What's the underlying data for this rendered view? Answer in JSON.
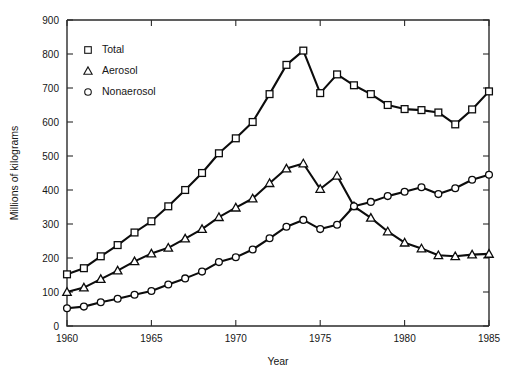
{
  "chart_data": {
    "type": "line",
    "title": "",
    "xlabel": "Year",
    "ylabel": "Millions of kilograms",
    "xlim": [
      1960,
      1985
    ],
    "ylim": [
      0,
      900
    ],
    "xticks": [
      1960,
      1965,
      1970,
      1975,
      1980,
      1985
    ],
    "yticks": [
      0,
      100,
      200,
      300,
      400,
      500,
      600,
      700,
      800,
      900
    ],
    "grid": false,
    "legend_position": "upper-left-inside",
    "x": [
      1960,
      1961,
      1962,
      1963,
      1964,
      1965,
      1966,
      1967,
      1968,
      1969,
      1970,
      1971,
      1972,
      1973,
      1974,
      1975,
      1976,
      1977,
      1978,
      1979,
      1980,
      1981,
      1982,
      1983,
      1984,
      1985
    ],
    "series": [
      {
        "name": "Total",
        "marker": "square",
        "values": [
          152,
          170,
          205,
          238,
          275,
          308,
          352,
          400,
          450,
          508,
          552,
          600,
          682,
          768,
          810,
          685,
          740,
          708,
          682,
          650,
          638,
          635,
          628,
          593,
          637,
          690
        ]
      },
      {
        "name": "Aerosol",
        "marker": "triangle",
        "values": [
          100,
          113,
          138,
          163,
          190,
          213,
          230,
          257,
          285,
          320,
          348,
          375,
          420,
          463,
          478,
          403,
          442,
          352,
          318,
          278,
          245,
          228,
          208,
          205,
          210,
          212
        ]
      },
      {
        "name": "Nonaerosol",
        "marker": "circle",
        "values": [
          52,
          57,
          70,
          80,
          92,
          103,
          122,
          140,
          160,
          188,
          202,
          225,
          258,
          292,
          312,
          285,
          298,
          352,
          365,
          382,
          395,
          408,
          388,
          405,
          430,
          445
        ]
      }
    ]
  },
  "legend": {
    "items": [
      {
        "label": "Total",
        "marker": "square"
      },
      {
        "label": "Aerosol",
        "marker": "triangle"
      },
      {
        "label": "Nonaerosol",
        "marker": "circle"
      }
    ]
  },
  "axes": {
    "y_title": "Millions of kilograms",
    "x_title": "Year"
  }
}
